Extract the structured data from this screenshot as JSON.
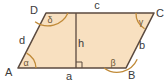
{
  "figure": {
    "kind": "parallelogram-geometry-diagram",
    "colors": {
      "fill": "#f8e0c0",
      "stroke": "#5b4a3f",
      "arc": "#c08a38",
      "label_text": "#3a3a3a",
      "angle_text": "#6b5636",
      "background": "#ffffff"
    },
    "vertices": [
      {
        "id": "A",
        "label": "A",
        "x": 18,
        "y": 68,
        "label_x": 5,
        "label_y": 73
      },
      {
        "id": "B",
        "label": "B",
        "x": 126,
        "y": 68,
        "label_x": 128,
        "label_y": 78
      },
      {
        "id": "C",
        "label": "C",
        "x": 154,
        "y": 13,
        "label_x": 156,
        "label_y": 13
      },
      {
        "id": "D",
        "label": "D",
        "x": 46,
        "y": 13,
        "label_x": 31,
        "label_y": 11
      }
    ],
    "sides": [
      {
        "id": "a",
        "label": "a",
        "from": "A",
        "to": "B",
        "label_x": 69,
        "label_y": 80
      },
      {
        "id": "b",
        "label": "b",
        "from": "B",
        "to": "C",
        "label_x": 142,
        "label_y": 46
      },
      {
        "id": "c",
        "label": "c",
        "from": "D",
        "to": "C",
        "label_x": 97,
        "label_y": 9
      },
      {
        "id": "d",
        "label": "d",
        "from": "A",
        "to": "D",
        "label_x": 22,
        "label_y": 41
      }
    ],
    "height": {
      "id": "h",
      "label": "h",
      "x": 76,
      "y_top": 13,
      "y_bottom": 68,
      "label_x": 80,
      "label_y": 44,
      "right_angle_marker": true
    },
    "angles": [
      {
        "id": "alpha",
        "label": "α",
        "at": "A",
        "label_x": 25,
        "label_y": 66
      },
      {
        "id": "beta",
        "label": "β",
        "at": "B",
        "label_x": 110,
        "label_y": 66
      },
      {
        "id": "gamma",
        "label": "γ",
        "at": "C",
        "label_x": 140,
        "label_y": 24
      },
      {
        "id": "delta",
        "label": "δ",
        "at": "D",
        "label_x": 49,
        "label_y": 22
      }
    ]
  }
}
